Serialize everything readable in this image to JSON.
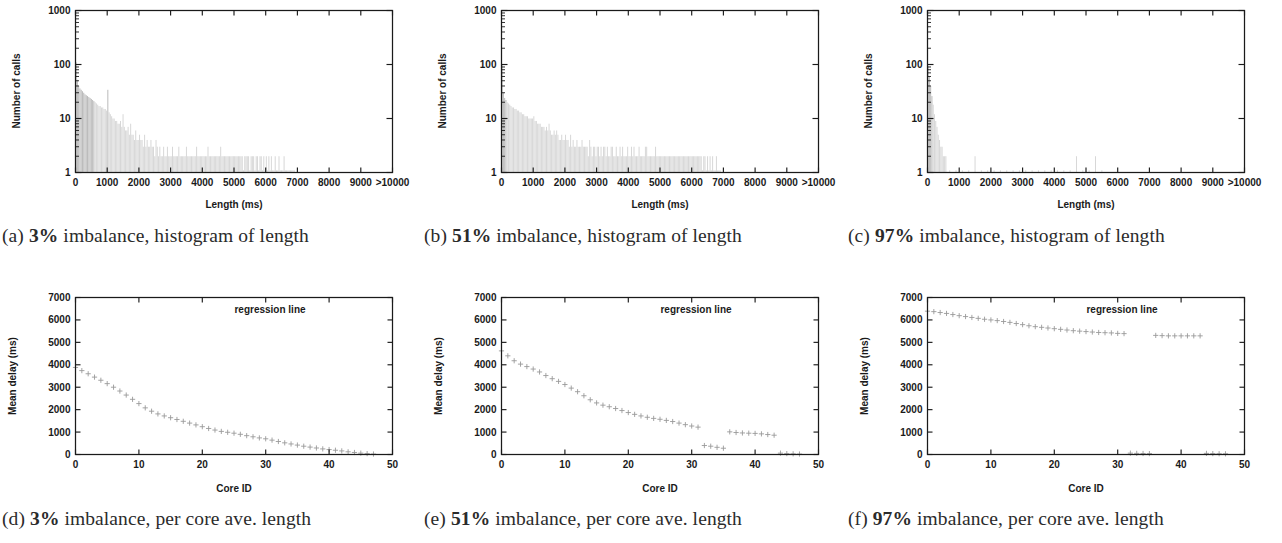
{
  "figure": {
    "panels": [
      {
        "tag": "(a)",
        "caption_percent": "3%",
        "caption_rest": " imbalance, histogram of length",
        "xlabel": "Length (ms)",
        "ylabel": "Number of calls"
      },
      {
        "tag": "(b)",
        "caption_percent": "51%",
        "caption_rest": " imbalance, histogram of length",
        "xlabel": "Length (ms)",
        "ylabel": "Number of calls"
      },
      {
        "tag": "(c)",
        "caption_percent": "97%",
        "caption_rest": " imbalance, histogram of length",
        "xlabel": "Length (ms)",
        "ylabel": "Number of calls"
      },
      {
        "tag": "(d)",
        "caption_percent": "3%",
        "caption_rest": " imbalance, per core ave. length",
        "xlabel": "Core ID",
        "ylabel": "Mean delay (ms)",
        "annotation": "regression line"
      },
      {
        "tag": "(e)",
        "caption_percent": "51%",
        "caption_rest": " imbalance, per core ave. length",
        "xlabel": "Core ID",
        "ylabel": "Mean delay (ms)",
        "annotation": "regression line"
      },
      {
        "tag": "(f)",
        "caption_percent": "97%",
        "caption_rest": " imbalance, per core ave. length",
        "xlabel": "Core ID",
        "ylabel": "Mean delay (ms)",
        "annotation": "regression line"
      }
    ]
  },
  "chart_data": [
    {
      "type": "bar",
      "panel": "a",
      "title": "3% imbalance, histogram of length",
      "xlabel": "Length (ms)",
      "ylabel": "Number of calls",
      "xlim": [
        0,
        10000
      ],
      "ylim": [
        1,
        1000
      ],
      "yscale": "log",
      "grid": false,
      "xticks": [
        0,
        1000,
        2000,
        3000,
        4000,
        5000,
        6000,
        7000,
        8000,
        9000,
        10000
      ],
      "xticklabels": [
        "0",
        "1000",
        "2000",
        "3000",
        "4000",
        "5000",
        "6000",
        "7000",
        "8000",
        "9000",
        ">10000"
      ],
      "yticks": [
        1,
        10,
        100,
        1000
      ],
      "yticklabels": [
        "1",
        "10",
        "100",
        "1000"
      ],
      "bin_width": 40,
      "x": [
        20,
        60,
        100,
        140,
        180,
        220,
        260,
        300,
        340,
        380,
        420,
        460,
        500,
        540,
        580,
        620,
        660,
        700,
        740,
        780,
        820,
        860,
        900,
        940,
        980,
        1020,
        1060,
        1100,
        1140,
        1180,
        1220,
        1260,
        1300,
        1340,
        1380,
        1420,
        1460,
        1500,
        1540,
        1580,
        1620,
        1660,
        1700,
        1740,
        1780,
        1820,
        1860,
        1900,
        1940,
        1980,
        2020,
        2060,
        2100,
        2140,
        2180,
        2220,
        2260,
        2300,
        2340,
        2380,
        2420,
        2460,
        2500,
        2540,
        2580,
        2620,
        2660,
        2700,
        2740,
        2780,
        2820,
        2860,
        2900,
        2940,
        2980,
        3020,
        3060,
        3100,
        3140,
        3180,
        3220,
        3260,
        3300,
        3340,
        3380,
        3420,
        3460,
        3500,
        3540,
        3580,
        3620,
        3660,
        3700,
        3740,
        3780,
        3820,
        3860,
        3900,
        3940,
        3980,
        4020,
        4060,
        4100,
        4140,
        4180,
        4220,
        4260,
        4300,
        4340,
        4380,
        4420,
        4460,
        4500,
        4540,
        4580,
        4620,
        4660,
        4700,
        4740,
        4780,
        4820,
        4860,
        4900,
        4940,
        4980,
        5020,
        5060,
        5100,
        5140,
        5180,
        5220,
        5260,
        5300,
        5340,
        5380,
        5420,
        5460,
        5500,
        5540,
        5580,
        5620,
        5660,
        5700,
        5740,
        5780,
        5820,
        5860,
        5900,
        5940,
        5980,
        6020,
        6060,
        6100,
        6140,
        6180,
        6220,
        6260,
        6300,
        6340,
        6380,
        6420,
        6460,
        6500,
        6540,
        6580,
        6620,
        6660,
        6700,
        6740,
        6780,
        6820,
        6860,
        6900
      ],
      "values": [
        110,
        52,
        40,
        36,
        34,
        32,
        30,
        28,
        27,
        26,
        25,
        24,
        23,
        22,
        21,
        20,
        19,
        18,
        17,
        17,
        16,
        16,
        15,
        15,
        14,
        34,
        13,
        12,
        11,
        10,
        10,
        9,
        9,
        8,
        8,
        9,
        7,
        12,
        7,
        6,
        6,
        7,
        5,
        8,
        5,
        5,
        4,
        6,
        4,
        4,
        5,
        4,
        4,
        3,
        5,
        3,
        4,
        3,
        3,
        4,
        3,
        3,
        2,
        4,
        3,
        2,
        3,
        2,
        2,
        3,
        2,
        2,
        3,
        2,
        2,
        2,
        3,
        2,
        2,
        2,
        2,
        3,
        2,
        2,
        2,
        2,
        2,
        3,
        2,
        2,
        2,
        2,
        2,
        2,
        2,
        3,
        2,
        2,
        2,
        2,
        2,
        2,
        2,
        2,
        3,
        2,
        2,
        2,
        2,
        2,
        2,
        2,
        2,
        2,
        3,
        2,
        2,
        2,
        2,
        2,
        2,
        2,
        2,
        2,
        2,
        2,
        2,
        2,
        2,
        2,
        2,
        2,
        1,
        2,
        2,
        2,
        2,
        1,
        2,
        2,
        2,
        1,
        2,
        2,
        1,
        2,
        2,
        1,
        2,
        1,
        2,
        1,
        2,
        1,
        2,
        1,
        1,
        2,
        1,
        1,
        2,
        1,
        1,
        1,
        2,
        1,
        1,
        1,
        1,
        1,
        1,
        1,
        1,
        1,
        1
      ]
    },
    {
      "type": "bar",
      "panel": "b",
      "title": "51% imbalance, histogram of length",
      "xlabel": "Length (ms)",
      "ylabel": "Number of calls",
      "xlim": [
        0,
        10000
      ],
      "ylim": [
        1,
        1000
      ],
      "yscale": "log",
      "grid": false,
      "xticks": [
        0,
        1000,
        2000,
        3000,
        4000,
        5000,
        6000,
        7000,
        8000,
        9000,
        10000
      ],
      "xticklabels": [
        "0",
        "1000",
        "2000",
        "3000",
        "4000",
        "5000",
        "6000",
        "7000",
        "8000",
        "9000",
        ">10000"
      ],
      "yticks": [
        1,
        10,
        100,
        1000
      ],
      "yticklabels": [
        "1",
        "10",
        "100",
        "1000"
      ],
      "bin_width": 40,
      "x": [
        20,
        60,
        100,
        140,
        180,
        220,
        260,
        300,
        340,
        380,
        420,
        460,
        500,
        540,
        580,
        620,
        660,
        700,
        740,
        780,
        820,
        860,
        900,
        940,
        980,
        1020,
        1060,
        1100,
        1140,
        1180,
        1220,
        1260,
        1300,
        1340,
        1380,
        1420,
        1460,
        1500,
        1540,
        1580,
        1620,
        1660,
        1700,
        1740,
        1780,
        1820,
        1860,
        1900,
        1940,
        1980,
        2020,
        2060,
        2100,
        2140,
        2180,
        2220,
        2260,
        2300,
        2340,
        2380,
        2420,
        2460,
        2500,
        2540,
        2580,
        2620,
        2660,
        2700,
        2740,
        2780,
        2820,
        2860,
        2900,
        2940,
        2980,
        3020,
        3060,
        3100,
        3140,
        3180,
        3220,
        3260,
        3300,
        3340,
        3380,
        3420,
        3460,
        3500,
        3540,
        3580,
        3620,
        3660,
        3700,
        3740,
        3780,
        3820,
        3860,
        3900,
        3940,
        3980,
        4020,
        4060,
        4100,
        4140,
        4180,
        4220,
        4260,
        4300,
        4340,
        4380,
        4420,
        4460,
        4500,
        4540,
        4580,
        4620,
        4660,
        4700,
        4740,
        4780,
        4820,
        4860,
        4900,
        4940,
        4980,
        5020,
        5060,
        5100,
        5140,
        5180,
        5220,
        5260,
        5300,
        5340,
        5380,
        5420,
        5460,
        5500,
        5540,
        5580,
        5620,
        5660,
        5700,
        5740,
        5780,
        5820,
        5860,
        5900,
        5940,
        5980,
        6020,
        6060,
        6100,
        6140,
        6180,
        6220,
        6260,
        6300,
        6340,
        6380,
        6420,
        6460,
        6500,
        6540,
        6580,
        6620,
        6660,
        6700,
        6740,
        6780,
        6820,
        6860,
        6900
      ],
      "values": [
        100,
        30,
        24,
        22,
        20,
        19,
        18,
        17,
        16,
        16,
        15,
        15,
        14,
        14,
        13,
        13,
        12,
        12,
        11,
        11,
        11,
        10,
        10,
        10,
        10,
        11,
        9,
        9,
        8,
        8,
        8,
        7,
        7,
        7,
        6,
        7,
        6,
        8,
        6,
        5,
        5,
        6,
        5,
        6,
        5,
        4,
        4,
        5,
        4,
        4,
        5,
        4,
        4,
        3,
        5,
        3,
        4,
        3,
        3,
        4,
        3,
        3,
        3,
        4,
        3,
        3,
        3,
        3,
        2,
        4,
        3,
        2,
        3,
        3,
        2,
        3,
        3,
        2,
        3,
        2,
        3,
        3,
        2,
        3,
        2,
        2,
        3,
        3,
        2,
        2,
        3,
        2,
        2,
        3,
        2,
        3,
        2,
        2,
        2,
        3,
        2,
        2,
        3,
        2,
        3,
        2,
        2,
        2,
        3,
        2,
        2,
        2,
        2,
        3,
        3,
        2,
        2,
        2,
        2,
        2,
        2,
        3,
        2,
        2,
        2,
        2,
        2,
        2,
        2,
        2,
        2,
        2,
        2,
        2,
        2,
        2,
        2,
        2,
        2,
        2,
        2,
        2,
        2,
        2,
        2,
        2,
        2,
        2,
        2,
        2,
        2,
        2,
        2,
        2,
        2,
        2,
        2,
        2,
        1,
        2,
        2,
        1,
        2,
        1,
        2,
        1,
        2,
        1,
        1,
        2,
        1,
        1,
        1,
        1,
        1,
        1
      ]
    },
    {
      "type": "bar",
      "panel": "c",
      "title": "97% imbalance, histogram of length",
      "xlabel": "Length (ms)",
      "ylabel": "Number of calls",
      "xlim": [
        0,
        10000
      ],
      "ylim": [
        1,
        1000
      ],
      "yscale": "log",
      "grid": false,
      "xticks": [
        0,
        1000,
        2000,
        3000,
        4000,
        5000,
        6000,
        7000,
        8000,
        9000,
        10000
      ],
      "xticklabels": [
        "0",
        "1000",
        "2000",
        "3000",
        "4000",
        "5000",
        "6000",
        "7000",
        "8000",
        "9000",
        ">10000"
      ],
      "yticks": [
        1,
        10,
        100,
        1000
      ],
      "yticklabels": [
        "1",
        "10",
        "100",
        "1000"
      ],
      "bin_width": 40,
      "x": [
        20,
        60,
        100,
        140,
        180,
        220,
        260,
        300,
        340,
        380,
        420,
        460,
        500,
        540,
        580,
        700,
        900,
        1100,
        1300,
        1500,
        1700,
        1900,
        2100,
        2300,
        2500,
        2700,
        2900,
        3100,
        3300,
        3500,
        3700,
        3900,
        4100,
        4300,
        4500,
        4700,
        4900,
        5100,
        5300,
        5500
      ],
      "values": [
        95,
        60,
        40,
        26,
        18,
        12,
        9,
        7,
        5,
        4,
        3,
        3,
        2,
        2,
        2,
        1,
        1,
        1,
        1,
        2,
        1,
        1,
        1,
        1,
        1,
        1,
        1,
        1,
        1,
        1,
        1,
        1,
        1,
        1,
        1,
        2,
        1,
        1,
        2,
        1
      ]
    },
    {
      "type": "scatter",
      "panel": "d",
      "title": "3% imbalance, per core ave. length",
      "xlabel": "Core ID",
      "ylabel": "Mean delay (ms)",
      "annotation": "regression line",
      "xlim": [
        0,
        50
      ],
      "ylim": [
        0,
        7000
      ],
      "grid": false,
      "xticks": [
        0,
        10,
        20,
        30,
        40,
        50
      ],
      "yticks": [
        0,
        1000,
        2000,
        3000,
        4000,
        5000,
        6000,
        7000
      ],
      "marker": "+",
      "x": [
        0,
        1,
        2,
        3,
        4,
        5,
        6,
        7,
        8,
        9,
        10,
        11,
        12,
        13,
        14,
        15,
        16,
        17,
        18,
        19,
        20,
        21,
        22,
        23,
        24,
        25,
        26,
        27,
        28,
        29,
        30,
        31,
        32,
        33,
        34,
        35,
        36,
        37,
        38,
        39,
        40,
        41,
        42,
        43,
        44,
        45,
        46,
        47
      ],
      "y": [
        3880,
        3740,
        3600,
        3450,
        3310,
        3160,
        3000,
        2830,
        2650,
        2460,
        2270,
        2080,
        1930,
        1810,
        1720,
        1640,
        1560,
        1480,
        1400,
        1320,
        1240,
        1160,
        1090,
        1030,
        990,
        950,
        900,
        840,
        790,
        740,
        700,
        640,
        580,
        520,
        470,
        420,
        370,
        330,
        290,
        250,
        220,
        190,
        160,
        120,
        90,
        60,
        40,
        20
      ]
    },
    {
      "type": "scatter",
      "panel": "e",
      "title": "51% imbalance, per core ave. length",
      "xlabel": "Core ID",
      "ylabel": "Mean delay (ms)",
      "annotation": "regression line",
      "xlim": [
        0,
        50
      ],
      "ylim": [
        0,
        7000
      ],
      "grid": false,
      "xticks": [
        0,
        10,
        20,
        30,
        40,
        50
      ],
      "yticks": [
        0,
        1000,
        2000,
        3000,
        4000,
        5000,
        6000,
        7000
      ],
      "marker": "+",
      "x": [
        0,
        1,
        2,
        3,
        4,
        5,
        6,
        7,
        8,
        9,
        10,
        11,
        12,
        13,
        14,
        15,
        16,
        17,
        18,
        19,
        20,
        21,
        22,
        23,
        24,
        25,
        26,
        27,
        28,
        29,
        30,
        31,
        32,
        33,
        34,
        35,
        36,
        37,
        38,
        39,
        40,
        41,
        42,
        43,
        44,
        45,
        46,
        47
      ],
      "y": [
        4620,
        4400,
        4180,
        4030,
        3920,
        3810,
        3680,
        3520,
        3380,
        3260,
        3120,
        2960,
        2800,
        2620,
        2440,
        2300,
        2200,
        2130,
        2050,
        1960,
        1870,
        1790,
        1720,
        1660,
        1610,
        1570,
        1520,
        1470,
        1400,
        1330,
        1270,
        1220,
        400,
        370,
        320,
        280,
        1010,
        980,
        960,
        950,
        940,
        920,
        890,
        860,
        60,
        40,
        30,
        20
      ]
    },
    {
      "type": "scatter",
      "panel": "f",
      "title": "97% imbalance, per core ave. length",
      "xlabel": "Core ID",
      "ylabel": "Mean delay (ms)",
      "annotation": "regression line",
      "xlim": [
        0,
        50
      ],
      "ylim": [
        0,
        7000
      ],
      "grid": false,
      "xticks": [
        0,
        10,
        20,
        30,
        40,
        50
      ],
      "yticks": [
        0,
        1000,
        2000,
        3000,
        4000,
        5000,
        6000,
        7000
      ],
      "marker": "+",
      "x": [
        0,
        1,
        2,
        3,
        4,
        5,
        6,
        7,
        8,
        9,
        10,
        11,
        12,
        13,
        14,
        15,
        16,
        17,
        18,
        19,
        20,
        21,
        22,
        23,
        24,
        25,
        26,
        27,
        28,
        29,
        30,
        31,
        32,
        33,
        34,
        35,
        36,
        37,
        38,
        39,
        40,
        41,
        42,
        43,
        44,
        45,
        46,
        47
      ],
      "y": [
        6390,
        6370,
        6330,
        6290,
        6240,
        6190,
        6150,
        6110,
        6070,
        6030,
        6000,
        5970,
        5930,
        5890,
        5840,
        5790,
        5740,
        5700,
        5670,
        5640,
        5610,
        5580,
        5550,
        5520,
        5500,
        5480,
        5460,
        5440,
        5430,
        5420,
        5400,
        5390,
        60,
        50,
        45,
        40,
        5310,
        5300,
        5290,
        5290,
        5290,
        5290,
        5290,
        5290,
        50,
        40,
        35,
        30
      ]
    }
  ]
}
